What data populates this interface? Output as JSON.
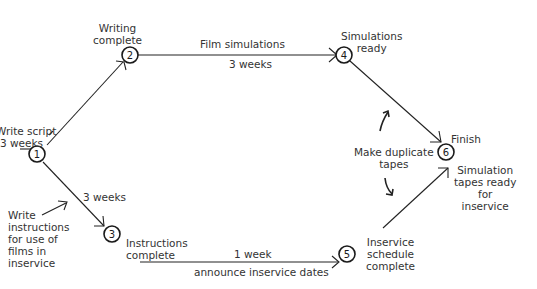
{
  "diagram": {
    "type": "PERT network",
    "nodes": [
      {
        "id": "1",
        "label": "1",
        "x": 37,
        "y": 154,
        "caption": ""
      },
      {
        "id": "2",
        "label": "2",
        "x": 130,
        "y": 55,
        "caption": "Writing complete"
      },
      {
        "id": "3",
        "label": "3",
        "x": 112,
        "y": 234,
        "caption": "Instructions complete"
      },
      {
        "id": "4",
        "label": "4",
        "x": 344,
        "y": 55,
        "caption": "Simulations ready"
      },
      {
        "id": "5",
        "label": "5",
        "x": 347,
        "y": 254,
        "caption": "Inservice schedule complete"
      },
      {
        "id": "6",
        "label": "6",
        "x": 446,
        "y": 152,
        "caption": "Finish"
      }
    ],
    "edges": [
      {
        "from": "1",
        "to": "2",
        "activity": "Write script",
        "duration": "3 weeks"
      },
      {
        "from": "2",
        "to": "4",
        "activity": "Film simulations",
        "duration": "3 weeks"
      },
      {
        "from": "1",
        "to": "3",
        "activity": "Write instructions for use of films in inservice",
        "duration": "3 weeks"
      },
      {
        "from": "3",
        "to": "5",
        "activity": "announce inservice dates",
        "duration": "1 week"
      },
      {
        "from": "4",
        "to": "6",
        "activity": "Make duplicate tapes",
        "duration": ""
      },
      {
        "from": "5",
        "to": "6",
        "activity": "Make duplicate tapes",
        "duration": ""
      }
    ]
  },
  "labels": {
    "write_script_line1": "Write script",
    "write_script_line2": "3 weeks",
    "writing_complete_line1": "Writing",
    "writing_complete_line2": "complete",
    "film_simulations": "Film simulations",
    "film_duration": "3 weeks",
    "simulations_ready_line1": "Simulations",
    "simulations_ready_line2": "ready",
    "finish": "Finish",
    "make_duplicate_line1": "Make duplicate",
    "make_duplicate_line2": "tapes",
    "sim_tapes_line1": "Simulation",
    "sim_tapes_line2": "tapes ready",
    "sim_tapes_line3": "for",
    "sim_tapes_line4": "inservice",
    "instructions_duration": "3 weeks",
    "write_instr_line1": "Write",
    "write_instr_line2": "instructions",
    "write_instr_line3": "for use of",
    "write_instr_line4": "films in",
    "write_instr_line5": "inservice",
    "instructions_complete_line1": "Instructions",
    "instructions_complete_line2": "complete",
    "announce_duration": "1 week",
    "announce_dates": "announce inservice dates",
    "inservice_line1": "Inservice",
    "inservice_line2": "schedule",
    "inservice_line3": "complete"
  }
}
